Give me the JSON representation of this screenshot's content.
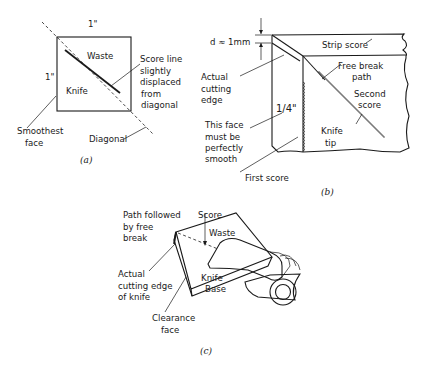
{
  "figure": {
    "panel_a": {
      "caption": "(a)",
      "dim_top": "1\"",
      "dim_left": "1\"",
      "region_waste": "Waste",
      "region_knife": "Knife",
      "score_label": [
        "Score line",
        "slightly",
        "displaced",
        "from",
        "diagonal"
      ],
      "smoothest_label": [
        "Smoothest",
        "face"
      ],
      "diagonal_label": "Diagonal"
    },
    "panel_b": {
      "caption": "(b)",
      "d_label": "d ≈ 1mm",
      "strip_score": "Strip score",
      "actual_cutting_edge": [
        "Actual",
        "cutting",
        "edge"
      ],
      "free_break_path": [
        "Free break",
        "path"
      ],
      "second_score": [
        "Second",
        "score"
      ],
      "quarter_inch": "1/4\"",
      "smooth_face": [
        "This face",
        "must be",
        "perfectly",
        "smooth"
      ],
      "knife_tip": [
        "Knife",
        "tip"
      ],
      "first_score": "First score"
    },
    "panel_c": {
      "caption": "(c)",
      "path_followed": [
        "Path followed",
        "by free",
        "break"
      ],
      "score": "Score",
      "waste": "Waste",
      "actual_cutting_edge": [
        "Actual",
        "cutting edge",
        "of knife"
      ],
      "knife_base": [
        "Knife",
        "Base"
      ],
      "clearance_face": [
        "Clearance",
        "face"
      ]
    }
  }
}
